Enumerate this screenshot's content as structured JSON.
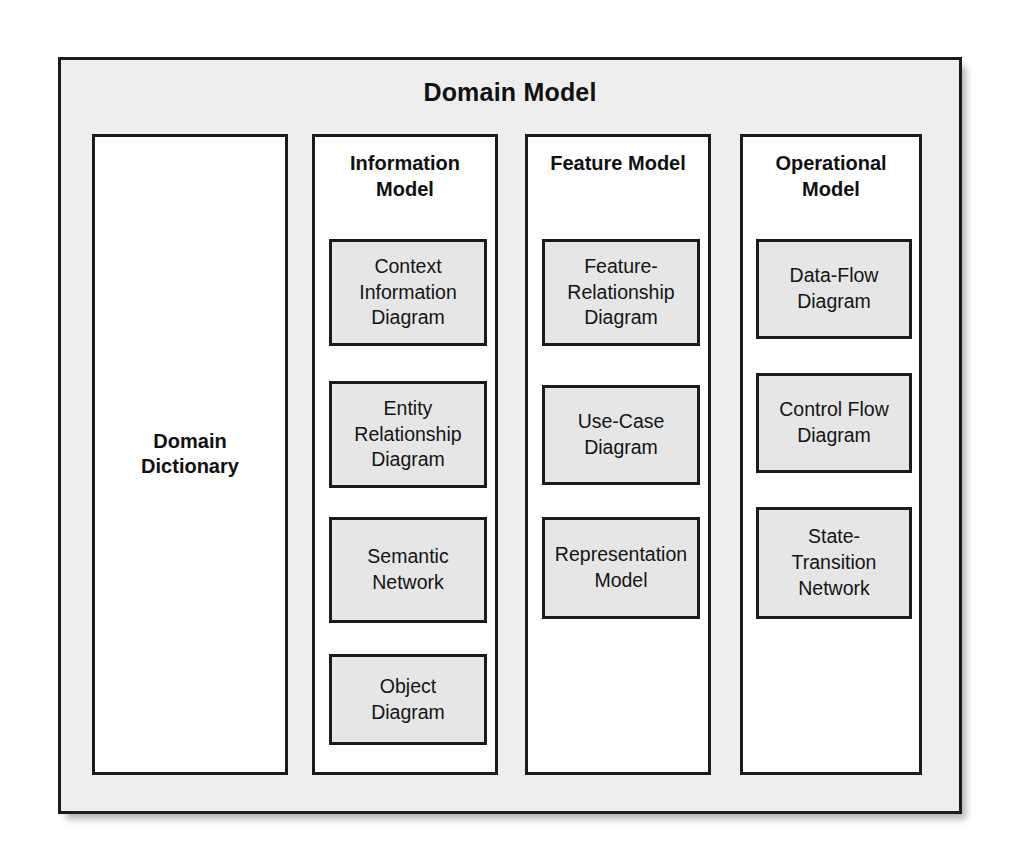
{
  "diagram": {
    "title": "Domain Model",
    "columns": [
      {
        "id": "domain-dictionary",
        "title": "Domain\nDictionary",
        "title_lines": [
          "Domain",
          "Dictionary"
        ],
        "items": []
      },
      {
        "id": "information-model",
        "title": "Information Model",
        "title_lines": [
          "Information",
          "Model"
        ],
        "items": [
          {
            "label_lines": [
              "Context",
              "Information",
              "Diagram"
            ],
            "label": "Context Information Diagram"
          },
          {
            "label_lines": [
              "Entity",
              "Relationship",
              "Diagram"
            ],
            "label": "Entity Relationship Diagram"
          },
          {
            "label_lines": [
              "Semantic",
              "Network"
            ],
            "label": "Semantic Network"
          },
          {
            "label_lines": [
              "Object",
              "Diagram"
            ],
            "label": "Object Diagram"
          }
        ]
      },
      {
        "id": "feature-model",
        "title": "Feature Model",
        "title_lines": [
          "Feature Model"
        ],
        "items": [
          {
            "label_lines": [
              "Feature-",
              "Relationship",
              "Diagram"
            ],
            "label": "Feature-Relationship Diagram"
          },
          {
            "label_lines": [
              "Use-Case",
              "Diagram"
            ],
            "label": "Use-Case Diagram"
          },
          {
            "label_lines": [
              "Representation",
              "Model"
            ],
            "label": "Representation Model"
          }
        ]
      },
      {
        "id": "operational-model",
        "title": "Operational Model",
        "title_lines": [
          "Operational",
          "Model"
        ],
        "items": [
          {
            "label_lines": [
              "Data-Flow",
              "Diagram"
            ],
            "label": "Data-Flow Diagram"
          },
          {
            "label_lines": [
              "Control Flow",
              "Diagram"
            ],
            "label": "Control Flow Diagram"
          },
          {
            "label_lines": [
              "State-",
              "Transition",
              "Network"
            ],
            "label": "State-Transition Network"
          }
        ]
      }
    ]
  },
  "colors": {
    "page_background": "#ffffff",
    "frame_fill": "#eeeeee",
    "column_fill": "#ffffff",
    "item_fill": "#e6e6e6",
    "stroke": "#1b1b1b",
    "text": "#111111"
  }
}
